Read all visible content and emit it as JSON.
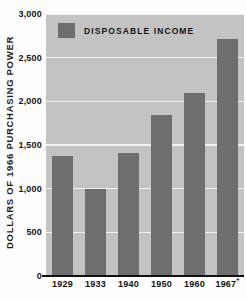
{
  "chart_data": {
    "type": "bar",
    "title": "",
    "subtitle": "",
    "xlabel": "",
    "ylabel": "DOLLARS OF 1966 PURCHASING POWER",
    "categories": [
      "1929",
      "1933",
      "1940",
      "1950",
      "1960",
      "1967*"
    ],
    "values": [
      1375,
      995,
      1410,
      1840,
      2100,
      2710
    ],
    "series": [
      {
        "name": "DISPOSABLE INCOME",
        "values": [
          1375,
          995,
          1410,
          1840,
          2100,
          2710
        ]
      }
    ],
    "ylim": [
      0,
      3000
    ],
    "ytick_values": [
      0,
      500,
      1000,
      1500,
      2000,
      2500,
      3000
    ],
    "ytick_labels": [
      "0",
      "500",
      "1,000",
      "1,500",
      "2,000",
      "2,500",
      "3,000"
    ],
    "grid": true,
    "legend_position": "top-left-inside",
    "legend_entries": [
      "DISPOSABLE INCOME"
    ],
    "annotations": [
      "* indicates 1967 value is preliminary or estimated"
    ],
    "colors": {
      "bar": "#6e6e6e",
      "plot_background": "#c3c3c3",
      "gridline": "#f2f2f2",
      "axis": "#111111",
      "text": "#141414",
      "page_background": "#fdfdfd"
    }
  },
  "legend": {
    "label": "DISPOSABLE INCOME"
  },
  "axes": {
    "y_title": "DOLLARS OF 1966 PURCHASING POWER"
  }
}
